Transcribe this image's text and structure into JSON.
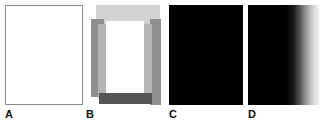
{
  "figure": {
    "width": 326,
    "height": 127,
    "background": "#ffffff",
    "panel_count": 4
  },
  "panels": [
    {
      "id": "A",
      "label": "A",
      "description": "blank white rectangle with thin grey outline",
      "fill": "#ffffff",
      "border_color": "#8c8c8c",
      "x": 5,
      "y": 5,
      "width": 78,
      "height": 100
    },
    {
      "id": "B",
      "label": "B",
      "description": "overlapping grey blocks forming an open rectangular frame with white interior",
      "x": 88,
      "y": 5,
      "width": 72,
      "height": 100,
      "blocks": [
        {
          "name": "top-light-band",
          "fill": "#d3d3d3",
          "x": 8,
          "y": 0,
          "width": 64,
          "height": 19
        },
        {
          "name": "left-bar",
          "fill": "#8f8f8f",
          "x": 3,
          "y": 14,
          "width": 13,
          "height": 78
        },
        {
          "name": "right-bar",
          "fill": "#8f8f8f",
          "x": 62,
          "y": 14,
          "width": 11,
          "height": 86
        },
        {
          "name": "left-bar-overlay",
          "fill": "#b4b4b4",
          "x": 10,
          "y": 19,
          "width": 8,
          "height": 74
        },
        {
          "name": "right-bar-overlay",
          "fill": "#b4b4b4",
          "x": 56,
          "y": 19,
          "width": 8,
          "height": 74
        },
        {
          "name": "interior-white",
          "fill": "#ffffff",
          "x": 18,
          "y": 16,
          "width": 38,
          "height": 77
        },
        {
          "name": "bottom-dark-band",
          "fill": "#555555",
          "x": 11,
          "y": 88,
          "width": 53,
          "height": 11
        }
      ]
    },
    {
      "id": "C",
      "label": "C",
      "description": "solid black rectangle",
      "fill": "#000000",
      "x": 169,
      "y": 5,
      "width": 74,
      "height": 100
    },
    {
      "id": "D",
      "label": "D",
      "description": "horizontal gradient from black on the left to white on the right",
      "gradient_direction": "left-to-right",
      "gradient_start": "#000000",
      "gradient_end": "#ffffff",
      "gradient_stops": [
        {
          "position_pct": 0,
          "color": "#000000"
        },
        {
          "position_pct": 52,
          "color": "#000000"
        },
        {
          "position_pct": 62,
          "color": "#1a1a1a"
        },
        {
          "position_pct": 70,
          "color": "#4d4d4d"
        },
        {
          "position_pct": 80,
          "color": "#9a9a9a"
        },
        {
          "position_pct": 90,
          "color": "#d8d8d8"
        },
        {
          "position_pct": 100,
          "color": "#ffffff"
        }
      ],
      "x": 248,
      "y": 5,
      "width": 73,
      "height": 100
    }
  ]
}
